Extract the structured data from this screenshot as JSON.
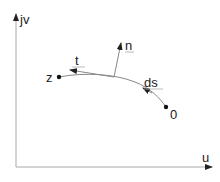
{
  "diagram": {
    "type": "complex-plane-path",
    "axes": {
      "vertical_label": "jv",
      "horizontal_label": "u",
      "color": "#a8a8a8"
    },
    "points": [
      {
        "id": "z",
        "label": "z",
        "x": 59,
        "y": 77
      },
      {
        "id": "origin_point",
        "label": "0",
        "x": 166,
        "y": 107
      }
    ],
    "vectors": [
      {
        "id": "tangent",
        "label": "t"
      },
      {
        "id": "normal",
        "label": "n"
      },
      {
        "id": "arc_element",
        "label": "ds"
      }
    ],
    "curve_color": "#888888",
    "text_color": "#222222"
  }
}
